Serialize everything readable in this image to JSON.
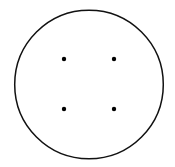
{
  "figure": {
    "canvas": {
      "width": 175,
      "height": 167,
      "background_color": "#ffffff"
    },
    "shapes": {
      "circle": {
        "name": "boundary-circle",
        "center_x": 89,
        "center_y": 84.5,
        "radius": 74.3,
        "stroke_color": "#111111",
        "stroke_width": 1.5,
        "fill": "none"
      },
      "points": [
        {
          "name": "point-top-left",
          "label": "top-left",
          "cx": 64,
          "cy": 59,
          "r": 2.2,
          "color": "#000000"
        },
        {
          "name": "point-top-right",
          "label": "top-right",
          "cx": 114,
          "cy": 59,
          "r": 2.2,
          "color": "#000000"
        },
        {
          "name": "point-bottom-left",
          "label": "bottom-left",
          "cx": 64,
          "cy": 109,
          "r": 2.2,
          "color": "#000000"
        },
        {
          "name": "point-bottom-right",
          "label": "bottom-right",
          "cx": 114,
          "cy": 109,
          "r": 2.2,
          "color": "#000000"
        }
      ]
    }
  }
}
